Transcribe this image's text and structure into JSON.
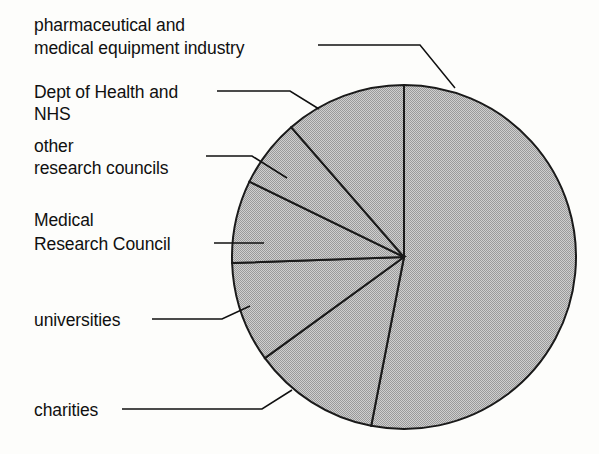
{
  "chart_data": {
    "type": "pie",
    "title": "",
    "subtitle": "",
    "xlabel": "",
    "ylabel": "",
    "legend_position": "callout-labels-left",
    "grid": false,
    "start_angle_deg": 0,
    "direction": "clockwise",
    "categories": [
      "pharmaceutical and medical equipment industry",
      "charities",
      "universities",
      "Medical Research Council",
      "other research councils",
      "Dept of Health and NHS"
    ],
    "values": [
      53,
      15,
      9,
      4.5,
      6.5,
      12
    ],
    "units": "percent of total",
    "slices": [
      {
        "label": "pharmaceutical and medical equipment industry",
        "value": 53,
        "start_deg": 0,
        "end_deg": 191,
        "fill": "#b6b6b6"
      },
      {
        "label": "charities",
        "value": 15,
        "start_deg": 191,
        "end_deg": 234,
        "fill": "#b6b6b6"
      },
      {
        "label": "universities",
        "value": 9,
        "start_deg": 234,
        "end_deg": 268,
        "fill": "#b6b6b6"
      },
      {
        "label": "Medical Research Council",
        "value": 4.5,
        "start_deg": 268,
        "end_deg": 296,
        "fill": "#b6b6b6"
      },
      {
        "label": "other research councils",
        "value": 6.5,
        "start_deg": 296,
        "end_deg": 319,
        "fill": "#b6b6b6"
      },
      {
        "label": "Dept of Health and NHS",
        "value": 12,
        "start_deg": 319,
        "end_deg": 360,
        "fill": "#b6b6b6"
      }
    ]
  },
  "labels": {
    "pharmaceutical_line1": "pharmaceutical and",
    "pharmaceutical_line2": "medical equipment industry",
    "doh_line1": "Dept of Health and",
    "doh_line2": "NHS",
    "other_councils_line1": "other",
    "other_councils_line2": "research councils",
    "mrc_line1": "Medical",
    "mrc_line2": "Research Council",
    "universities": "universities",
    "charities": "charities"
  },
  "colors": {
    "background": "#fdfdfb",
    "slice_fill": "#b6b6b6",
    "slice_stroke": "#1a1a1a",
    "text": "#101010",
    "leader_line": "#101010"
  }
}
